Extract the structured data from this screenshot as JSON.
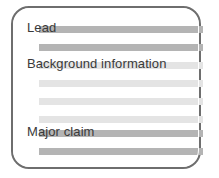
{
  "diagram": {
    "name": "article-structure-card",
    "card": {
      "border_color": "#6e6e6e",
      "background_color": "#ffffff"
    },
    "colors": {
      "bar_dark": "#b4b4b4",
      "bar_light": "#e4e4e4",
      "text": "#3a3a3a"
    },
    "lines": [
      {
        "id": "line-1",
        "tone": "dark",
        "top": 24
      },
      {
        "id": "line-2",
        "tone": "dark",
        "top": 42
      },
      {
        "id": "line-3",
        "tone": "light",
        "top": 60
      },
      {
        "id": "line-4",
        "tone": "light",
        "top": 78
      },
      {
        "id": "line-5",
        "tone": "light",
        "top": 96
      },
      {
        "id": "line-6",
        "tone": "light",
        "top": 114
      },
      {
        "id": "line-7",
        "tone": "dark",
        "top": 128
      },
      {
        "id": "line-8",
        "tone": "dark",
        "top": 146
      }
    ],
    "labels": {
      "lead": "Lead",
      "background": "Background information",
      "major_claim": "Major claim"
    }
  }
}
